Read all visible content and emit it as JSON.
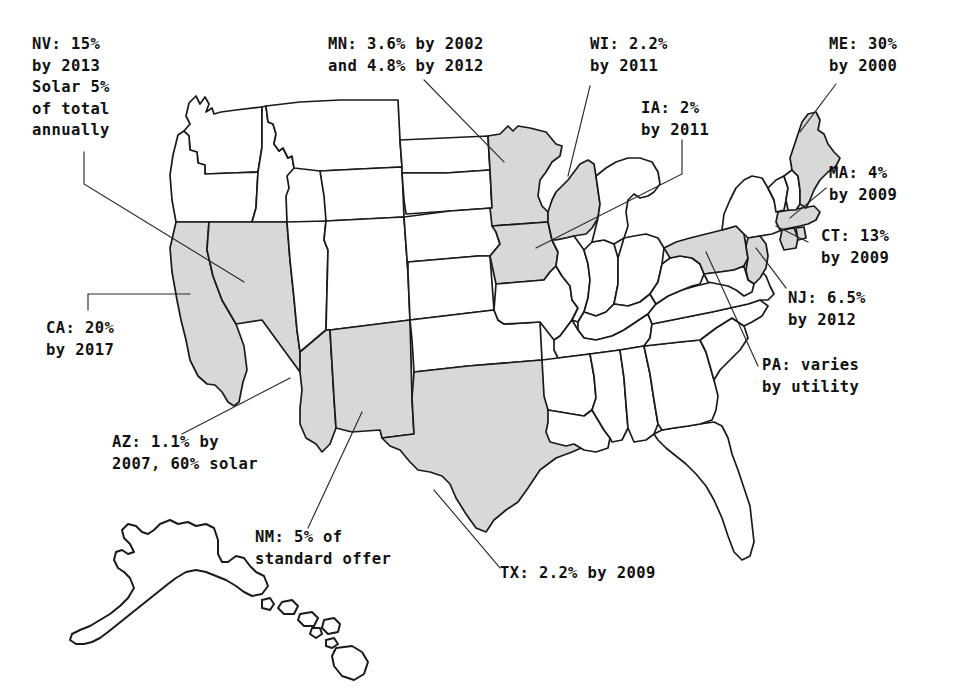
{
  "map": {
    "title": "State Renewable Portfolio Standards",
    "shaded_color": "#d8d8d8",
    "outline_color": "#1a1a1a",
    "background_color": "#ffffff",
    "shaded_states": [
      "CA",
      "NV",
      "AZ",
      "NM",
      "TX",
      "MN",
      "IA",
      "WI",
      "ME",
      "MA",
      "CT",
      "NJ",
      "PA"
    ]
  },
  "callouts": [
    {
      "id": "nv",
      "state": "NV",
      "text": "NV: 15%\nby 2013\nSolar 5%\nof total\nannually"
    },
    {
      "id": "mn",
      "state": "MN",
      "text": "MN: 3.6% by 2002\nand 4.8% by 2012"
    },
    {
      "id": "wi",
      "state": "WI",
      "text": "WI: 2.2%\nby 2011"
    },
    {
      "id": "ia",
      "state": "IA",
      "text": "IA: 2%\nby 2011"
    },
    {
      "id": "me",
      "state": "ME",
      "text": "ME: 30%\nby 2000"
    },
    {
      "id": "ma",
      "state": "MA",
      "text": "MA: 4%\nby 2009"
    },
    {
      "id": "ct",
      "state": "CT",
      "text": "CT: 13%\nby 2009"
    },
    {
      "id": "nj",
      "state": "NJ",
      "text": "NJ: 6.5%\nby 2012"
    },
    {
      "id": "pa",
      "state": "PA",
      "text": "PA: varies\nby utility"
    },
    {
      "id": "ca",
      "state": "CA",
      "text": "CA: 20%\nby 2017"
    },
    {
      "id": "az",
      "state": "AZ",
      "text": "AZ: 1.1% by\n2007, 60% solar"
    },
    {
      "id": "nm",
      "state": "NM",
      "text": "NM: 5% of\nstandard offer"
    },
    {
      "id": "tx",
      "state": "TX",
      "text": "TX: 2.2% by 2009"
    }
  ]
}
